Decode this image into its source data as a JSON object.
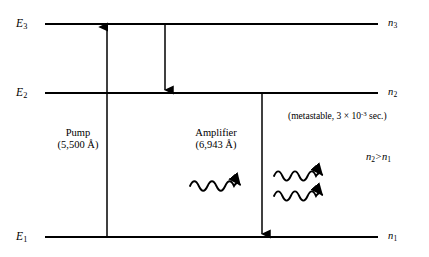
{
  "figure": {
    "background_color": "#ffffff",
    "stroke_color": "#000000"
  },
  "levels": {
    "e3": {
      "left_label_base": "E",
      "left_label_sub": "3",
      "right_label_base": "n",
      "right_label_sub": "3"
    },
    "e2": {
      "left_label_base": "E",
      "left_label_sub": "2",
      "right_label_base": "n",
      "right_label_sub": "2"
    },
    "e1": {
      "left_label_base": "E",
      "left_label_sub": "1",
      "right_label_base": "n",
      "right_label_sub": "1"
    }
  },
  "transitions": {
    "pump": {
      "name_label": "Pump",
      "wavelength_label": "(5,500 Å)",
      "direction": "up"
    },
    "decay": {
      "direction": "down"
    },
    "amplifier": {
      "name_label": "Amplifier",
      "wavelength_label": "(6,943 Å)",
      "direction": "down"
    }
  },
  "annotations": {
    "metastable": {
      "prefix": "(metastable, 3",
      "times": " × ",
      "mantissa": "10",
      "exponent": "-3",
      "suffix": " sec.)",
      "full_text": "(metastable, 3 × 10-3 sec.)"
    },
    "population_inversion": {
      "left_base": "n",
      "left_sub": "2",
      "relation": ">",
      "right_base": "n",
      "right_sub": "1",
      "full_text": "n2 > n1"
    }
  },
  "photons": {
    "incident": {
      "count": 1,
      "label": "incident-photon"
    },
    "emitted": {
      "count": 2,
      "label": "emitted-photons"
    }
  }
}
